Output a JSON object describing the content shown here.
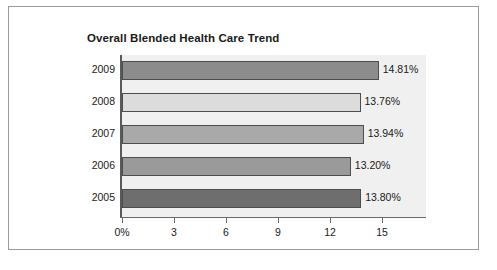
{
  "figure": {
    "title": "Overall Blended Health Care Trend"
  },
  "chart_data": {
    "type": "bar",
    "orientation": "horizontal",
    "title": "Overall Blended Health Care Trend",
    "xlabel": "",
    "ylabel": "",
    "categories": [
      "2009",
      "2008",
      "2007",
      "2006",
      "2005"
    ],
    "values": [
      14.81,
      13.76,
      13.94,
      13.2,
      13.8
    ],
    "value_labels": [
      "14.81%",
      "13.76%",
      "13.94%",
      "13.20%",
      "13.80%"
    ],
    "xlim": [
      0,
      17.6
    ],
    "xticks": [
      0,
      3,
      6,
      9,
      12,
      15
    ],
    "xtick_labels": [
      "0%",
      "3",
      "6",
      "9",
      "12",
      "15"
    ],
    "grid": false,
    "legend": "none",
    "bar_colors": [
      "#8c8c8c",
      "#dcdcdc",
      "#a9a9a9",
      "#9a9a9a",
      "#6e6e6e"
    ],
    "bar_border_color": "#4d4d4d",
    "plot_background": "#f0f0f0",
    "frame_color": "#9a9a9a"
  }
}
